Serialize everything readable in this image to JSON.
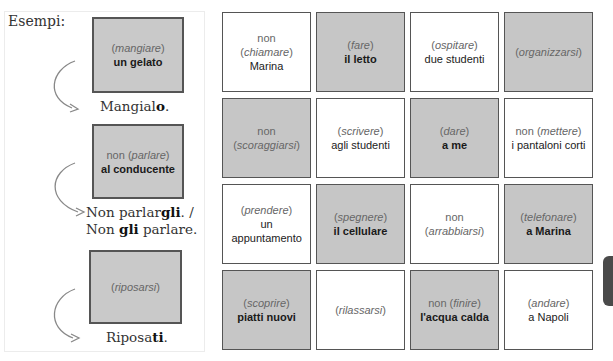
{
  "examples": {
    "heading": "Esempi:",
    "items": [
      {
        "prefix": "",
        "verb": "mangiare",
        "object": "un gelato",
        "answer_lines": [
          {
            "before": "Mangial",
            "bold": "o",
            "after": "."
          }
        ]
      },
      {
        "prefix": "non ",
        "verb": "parlare",
        "object": "al conducente",
        "answer_lines": [
          {
            "before": "Non parlar",
            "bold": "gli",
            "after": ". /"
          },
          {
            "before": "Non ",
            "bold": "gli",
            "after": " parlare."
          }
        ]
      },
      {
        "prefix": "",
        "verb": "riposarsi",
        "object": "",
        "answer_lines": [
          {
            "before": "Riposa",
            "bold": "ti",
            "after": "."
          }
        ]
      }
    ]
  },
  "grid": {
    "cells": [
      {
        "shade": "white",
        "prefix": "non",
        "verb": "chiamare",
        "object": "Marina"
      },
      {
        "shade": "gray",
        "prefix": "",
        "verb": "fare",
        "object": "il letto"
      },
      {
        "shade": "white",
        "prefix": "",
        "verb": "ospitare",
        "object": "due studenti"
      },
      {
        "shade": "gray",
        "prefix": "",
        "verb": "organizzarsi",
        "object": ""
      },
      {
        "shade": "gray",
        "prefix": "non",
        "verb": "scoraggiarsi",
        "object": ""
      },
      {
        "shade": "white",
        "prefix": "",
        "verb": "scrivere",
        "object": "agli studenti"
      },
      {
        "shade": "gray",
        "prefix": "",
        "verb": "dare",
        "object": "a me"
      },
      {
        "shade": "white",
        "prefix": "non",
        "verb": "mettere",
        "object": "i pantaloni corti",
        "inline_prefix": true
      },
      {
        "shade": "white",
        "prefix": "",
        "verb": "prendere",
        "object": "un appuntamento"
      },
      {
        "shade": "gray",
        "prefix": "",
        "verb": "spegnere",
        "object": "il cellulare"
      },
      {
        "shade": "white",
        "prefix": "non",
        "verb": "arrabbiarsi",
        "object": ""
      },
      {
        "shade": "gray",
        "prefix": "",
        "verb": "telefonare",
        "object": "a Marina"
      },
      {
        "shade": "gray",
        "prefix": "",
        "verb": "scoprire",
        "object": "piatti nuovi"
      },
      {
        "shade": "white",
        "prefix": "",
        "verb": "rilassarsi",
        "object": ""
      },
      {
        "shade": "gray",
        "prefix": "non",
        "verb": "finire",
        "object": "l'acqua calda",
        "inline_prefix": true
      },
      {
        "shade": "white",
        "prefix": "",
        "verb": "andare",
        "object": "a Napoli"
      }
    ]
  },
  "colors": {
    "gray_cell": "#c6c6c6",
    "border": "#555555",
    "side_tab": "#4a4a4a"
  }
}
